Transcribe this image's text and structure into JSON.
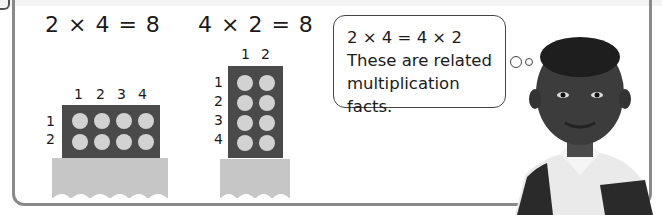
{
  "equations": {
    "left": "2 × 4 = 8",
    "right": "4 × 2 = 8"
  },
  "array_left": {
    "rows": 2,
    "cols": 4,
    "col_labels": [
      "1",
      "2",
      "3",
      "4"
    ],
    "row_labels": [
      "1",
      "2"
    ]
  },
  "array_right": {
    "rows": 4,
    "cols": 2,
    "col_labels": [
      "1",
      "2"
    ],
    "row_labels": [
      "1",
      "2",
      "3",
      "4"
    ]
  },
  "thought_bubble": {
    "line1": "2 × 4 = 4 × 2",
    "line2": "These are related",
    "line3": "multiplication facts."
  },
  "colors": {
    "array_fill": "#4a4a4a",
    "counter": "#d2d2d2",
    "base": "#c6c6c6",
    "frame": "#8a8a8a"
  }
}
